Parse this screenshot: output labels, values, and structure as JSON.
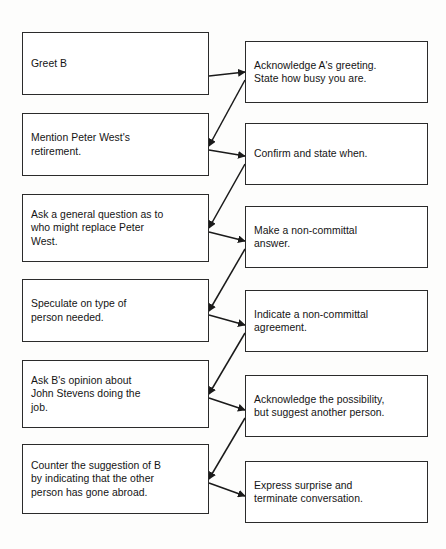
{
  "diagram": {
    "type": "flowchart",
    "title": "",
    "background_color": "#fdfdfc",
    "box_border_color": "#2b2b2b",
    "box_fill_color": "#ffffff",
    "connector_color": "#1a1a1a",
    "columns": [
      {
        "name": "speaker-a-column",
        "label": "A"
      },
      {
        "name": "speaker-b-column",
        "label": "B"
      }
    ],
    "left_boxes": [
      {
        "id": "a1",
        "text": "Greet B"
      },
      {
        "id": "a2",
        "text": "Mention Peter West's\nretirement."
      },
      {
        "id": "a3",
        "text": "Ask a general question as to\nwho might replace Peter\nWest."
      },
      {
        "id": "a4",
        "text": "Speculate on type of\nperson needed."
      },
      {
        "id": "a5",
        "text": "Ask B's opinion about\nJohn Stevens doing the\njob."
      },
      {
        "id": "a6",
        "text": "Counter the suggestion of B\nby indicating that the other\nperson has gone abroad."
      }
    ],
    "right_boxes": [
      {
        "id": "b1",
        "text": "Acknowledge A's greeting.\nState how busy you are."
      },
      {
        "id": "b2",
        "text": "Confirm and state when."
      },
      {
        "id": "b3",
        "text": "Make a non-committal\nanswer."
      },
      {
        "id": "b4",
        "text": "Indicate a non-committal\nagreement."
      },
      {
        "id": "b5",
        "text": "Acknowledge the possibility,\nbut suggest another person."
      },
      {
        "id": "b6",
        "text": "Express surprise and\nterminate conversation."
      }
    ],
    "connectors": [
      {
        "id": "c1",
        "from": "a1",
        "to": "b1",
        "direction": "left-to-right"
      },
      {
        "id": "c2",
        "from": "b1",
        "to": "a2",
        "direction": "right-to-left"
      },
      {
        "id": "c3",
        "from": "a2",
        "to": "b2",
        "direction": "left-to-right"
      },
      {
        "id": "c4",
        "from": "b2",
        "to": "a3",
        "direction": "right-to-left"
      },
      {
        "id": "c5",
        "from": "a3",
        "to": "b3",
        "direction": "left-to-right"
      },
      {
        "id": "c6",
        "from": "b3",
        "to": "a4",
        "direction": "right-to-left"
      },
      {
        "id": "c7",
        "from": "a4",
        "to": "b4",
        "direction": "left-to-right"
      },
      {
        "id": "c8",
        "from": "b4",
        "to": "a5",
        "direction": "right-to-left"
      },
      {
        "id": "c9",
        "from": "a5",
        "to": "b5",
        "direction": "left-to-right"
      },
      {
        "id": "c10",
        "from": "b5",
        "to": "a6",
        "direction": "right-to-left"
      },
      {
        "id": "c11",
        "from": "a6",
        "to": "b6",
        "direction": "left-to-right"
      }
    ]
  },
  "layout": {
    "left_geom": [
      {
        "x": 22,
        "y": 32,
        "w": 187,
        "h": 63
      },
      {
        "x": 22,
        "y": 113,
        "w": 187,
        "h": 63
      },
      {
        "x": 22,
        "y": 194,
        "w": 187,
        "h": 68
      },
      {
        "x": 22,
        "y": 279,
        "w": 187,
        "h": 63
      },
      {
        "x": 22,
        "y": 360,
        "w": 187,
        "h": 68
      },
      {
        "x": 22,
        "y": 444,
        "w": 187,
        "h": 70
      }
    ],
    "right_geom": [
      {
        "x": 245,
        "y": 41,
        "w": 183,
        "h": 62
      },
      {
        "x": 245,
        "y": 123,
        "w": 183,
        "h": 62
      },
      {
        "x": 245,
        "y": 206,
        "w": 183,
        "h": 62
      },
      {
        "x": 245,
        "y": 290,
        "w": 183,
        "h": 62
      },
      {
        "x": 245,
        "y": 375,
        "w": 183,
        "h": 62
      },
      {
        "x": 245,
        "y": 461,
        "w": 183,
        "h": 62
      }
    ]
  }
}
